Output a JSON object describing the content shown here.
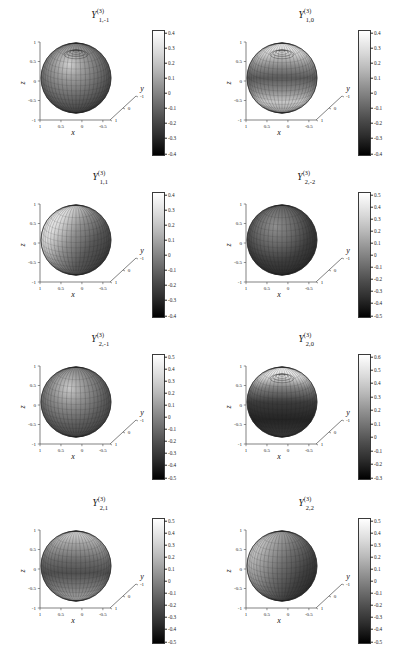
{
  "figure": {
    "type": "multi-panel-3d-surface-grid",
    "rows": 4,
    "cols": 2,
    "background": "#ffffff",
    "colormap": "grayscale",
    "axis_labels": {
      "x": "x",
      "y": "y",
      "z": "z"
    }
  },
  "chart_data": {
    "type": "heatmap",
    "xlabel": "x",
    "ylabel": "y",
    "zlabel": "z",
    "grid": true,
    "legend": "colorbar-right",
    "colormap": "gray",
    "shared_axes": {
      "x_ticks": [
        "1",
        "0.5",
        "0",
        "-0.5"
      ],
      "y_ticks": [
        "-1",
        "0",
        "1"
      ],
      "z_ticks": [
        "1",
        "0.5",
        "0",
        "-0.5",
        "-1"
      ],
      "xlim": [
        -1,
        1
      ],
      "ylim": [
        -1,
        1
      ],
      "zlim": [
        -1,
        1
      ]
    },
    "panels": [
      {
        "title_base": "Y",
        "title_sup": "(3)",
        "title_sub": "1,-1",
        "degree": 3,
        "n": 1,
        "m": -1,
        "cbar_min": -0.4,
        "cbar_max": 0.4,
        "cbar_ticks": [
          "0.4",
          "0.3",
          "0.2",
          "0.1",
          "0",
          "-0.1",
          "-0.2",
          "-0.3",
          "-0.4"
        ],
        "pattern": "polar-cap-swirl",
        "x_ticks": [
          "1",
          "0.5",
          "0",
          "-0.5"
        ],
        "y_ticks": [
          "-1",
          "0",
          "1"
        ],
        "z_ticks": [
          "1",
          "0.5",
          "0",
          "-0.5",
          "-1"
        ]
      },
      {
        "title_base": "Y",
        "title_sup": "(3)",
        "title_sub": "1,0",
        "degree": 3,
        "n": 1,
        "m": 0,
        "cbar_min": -0.4,
        "cbar_max": 0.4,
        "cbar_ticks": [
          "0.4",
          "0.3",
          "0.2",
          "0.1",
          "0",
          "-0.1",
          "-0.2",
          "-0.3",
          "-0.4"
        ],
        "pattern": "zonal-rings",
        "x_ticks": [
          "1",
          "0.5",
          "0",
          "-0.5"
        ],
        "y_ticks": [
          "-1",
          "0",
          "1"
        ],
        "z_ticks": [
          "1",
          "0.5",
          "0",
          "-0.5",
          "-1"
        ]
      },
      {
        "title_base": "Y",
        "title_sup": "(3)",
        "title_sub": "1,1",
        "degree": 3,
        "n": 1,
        "m": 1,
        "cbar_min": -0.4,
        "cbar_max": 0.4,
        "cbar_ticks": [
          "0.4",
          "0.3",
          "0.2",
          "0.1",
          "0",
          "-0.1",
          "-0.2",
          "-0.3",
          "-0.4"
        ],
        "pattern": "sectoral-bright-left",
        "x_ticks": [
          "1",
          "0.5",
          "0",
          "-0.5"
        ],
        "y_ticks": [
          "-1",
          "0",
          "1"
        ],
        "z_ticks": [
          "1",
          "0.5",
          "0",
          "-0.5",
          "-1"
        ]
      },
      {
        "title_base": "Y",
        "title_sup": "(3)",
        "title_sub": "2,-2",
        "degree": 3,
        "n": 2,
        "m": -2,
        "cbar_min": -0.5,
        "cbar_max": 0.5,
        "cbar_ticks": [
          "0.5",
          "0.4",
          "0.3",
          "0.2",
          "0.1",
          "0",
          "-0.1",
          "-0.2",
          "-0.3",
          "-0.4",
          "-0.5"
        ],
        "pattern": "dark-equatorial-band",
        "x_ticks": [
          "1",
          "0.5",
          "0",
          "-0.5"
        ],
        "y_ticks": [
          "-1",
          "0",
          "1"
        ],
        "z_ticks": [
          "1",
          "0.5",
          "0",
          "-0.5",
          "-1"
        ]
      },
      {
        "title_base": "Y",
        "title_sup": "(3)",
        "title_sub": "2,-1",
        "degree": 3,
        "n": 2,
        "m": -1,
        "cbar_min": -0.5,
        "cbar_max": 0.5,
        "cbar_ticks": [
          "0.5",
          "0.4",
          "0.3",
          "0.2",
          "0.1",
          "0",
          "-0.1",
          "-0.2",
          "-0.3",
          "-0.4",
          "-0.5"
        ],
        "pattern": "tesseral-vertical-lobes",
        "x_ticks": [
          "1",
          "0.5",
          "0",
          "-0.5"
        ],
        "y_ticks": [
          "-1",
          "0",
          "1"
        ],
        "z_ticks": [
          "1",
          "0.5",
          "0",
          "-0.5",
          "-1"
        ]
      },
      {
        "title_base": "Y",
        "title_sup": "(3)",
        "title_sub": "2,0",
        "degree": 3,
        "n": 2,
        "m": 0,
        "cbar_min": -0.3,
        "cbar_max": 0.6,
        "cbar_ticks": [
          "0.6",
          "0.5",
          "0.4",
          "0.3",
          "0.2",
          "0.1",
          "0",
          "-0.1",
          "-0.2",
          "-0.3"
        ],
        "pattern": "bright-polar-cap-dark-body",
        "x_ticks": [
          "1",
          "0.5",
          "0",
          "-0.5"
        ],
        "y_ticks": [
          "-1",
          "0",
          "1"
        ],
        "z_ticks": [
          "1",
          "0.5",
          "0",
          "-0.5",
          "-1"
        ]
      },
      {
        "title_base": "Y",
        "title_sup": "(3)",
        "title_sub": "2,1",
        "degree": 3,
        "n": 2,
        "m": 1,
        "cbar_min": -0.5,
        "cbar_max": 0.5,
        "cbar_ticks": [
          "0.5",
          "0.4",
          "0.3",
          "0.2",
          "0.1",
          "0",
          "-0.1",
          "-0.2",
          "-0.3",
          "-0.4",
          "-0.5"
        ],
        "pattern": "mid-latitude-bands",
        "x_ticks": [
          "1",
          "0.5",
          "0",
          "-0.5"
        ],
        "y_ticks": [
          "-1",
          "0",
          "1"
        ],
        "z_ticks": [
          "1",
          "0.5",
          "0",
          "-0.5",
          "-1"
        ]
      },
      {
        "title_base": "Y",
        "title_sup": "(3)",
        "title_sub": "2,2",
        "degree": 3,
        "n": 2,
        "m": 2,
        "cbar_min": -0.5,
        "cbar_max": 0.5,
        "cbar_ticks": [
          "0.5",
          "0.4",
          "0.3",
          "0.2",
          "0.1",
          "0",
          "-0.1",
          "-0.2",
          "-0.3",
          "-0.4",
          "-0.5"
        ],
        "pattern": "sectoral-quadrants",
        "x_ticks": [
          "1",
          "0.5",
          "0",
          "-0.5"
        ],
        "y_ticks": [
          "-1",
          "0",
          "1"
        ],
        "z_ticks": [
          "1",
          "0.5",
          "0",
          "-0.5",
          "-1"
        ]
      }
    ]
  }
}
